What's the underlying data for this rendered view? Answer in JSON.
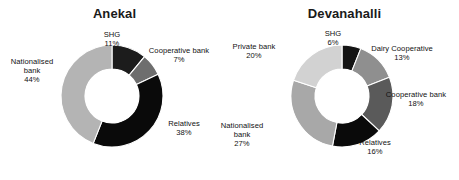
{
  "figure": {
    "background": "#ffffff",
    "width": 459,
    "height": 180
  },
  "chart_data": [
    {
      "type": "pie",
      "variant": "donut",
      "title": "Anekal",
      "xlabel": "",
      "ylabel": "",
      "legend_position": "none",
      "grid": false,
      "value_suffix": "%",
      "total": 100,
      "categories": [
        "SHG",
        "Cooperative bank",
        "Relatives",
        "Nationalised bank"
      ],
      "values": [
        11,
        7,
        38,
        44
      ],
      "labels": [
        "11%",
        "7%",
        "38%",
        "44%"
      ],
      "colors": [
        "#1c1c1c",
        "#6e6e6e",
        "#0a0a0a",
        "#b4b4b4"
      ],
      "slices": [
        {
          "name": "SHG",
          "value": 11,
          "label": "11%",
          "color": "#1c1c1c",
          "label_lines": [
            "SHG",
            "11%"
          ]
        },
        {
          "name": "Cooperative bank",
          "value": 7,
          "label": "7%",
          "color": "#6e6e6e",
          "label_lines": [
            "Cooperative bank",
            "7%"
          ]
        },
        {
          "name": "Relatives",
          "value": 38,
          "label": "38%",
          "color": "#0a0a0a",
          "label_lines": [
            "Relatives",
            "38%"
          ]
        },
        {
          "name": "Nationalised bank",
          "value": 44,
          "label": "44%",
          "color": "#b4b4b4",
          "label_lines": [
            "Nationalised",
            "bank",
            "44%"
          ]
        }
      ]
    },
    {
      "type": "pie",
      "variant": "donut",
      "title": "Devanahalli",
      "xlabel": "",
      "ylabel": "",
      "legend_position": "none",
      "grid": false,
      "value_suffix": "%",
      "total": 100,
      "categories": [
        "SHG",
        "Dairy Cooperative",
        "Cooperative bank",
        "Relatives",
        "Nationalised bank",
        "Private bank"
      ],
      "values": [
        6,
        13,
        18,
        16,
        27,
        20
      ],
      "labels": [
        "6%",
        "13%",
        "18%",
        "16%",
        "27%",
        "20%"
      ],
      "colors": [
        "#141414",
        "#8f8f8f",
        "#5a5a5a",
        "#0a0a0a",
        "#a8a8a8",
        "#d2d2d2"
      ],
      "slices": [
        {
          "name": "SHG",
          "value": 6,
          "label": "6%",
          "color": "#141414",
          "label_lines": [
            "SHG",
            "6%"
          ]
        },
        {
          "name": "Dairy Cooperative",
          "value": 13,
          "label": "13%",
          "color": "#8f8f8f",
          "label_lines": [
            "Dairy Cooperative",
            "13%"
          ]
        },
        {
          "name": "Cooperative bank",
          "value": 18,
          "label": "18%",
          "color": "#5a5a5a",
          "label_lines": [
            "Cooperative bank",
            "18%"
          ]
        },
        {
          "name": "Relatives",
          "value": 16,
          "label": "16%",
          "color": "#0a0a0a",
          "label_lines": [
            "Relatives",
            "16%"
          ]
        },
        {
          "name": "Nationalised bank",
          "value": 27,
          "label": "27%",
          "color": "#a8a8a8",
          "label_lines": [
            "Nationalised",
            "bank",
            "27%"
          ]
        },
        {
          "name": "Private bank",
          "value": 20,
          "label": "20%",
          "color": "#d2d2d2",
          "label_lines": [
            "Private bank",
            "20%"
          ]
        }
      ]
    }
  ],
  "geometry": {
    "anekal": {
      "cx": 112,
      "cy": 96,
      "outer_r": 51,
      "inner_r": 27,
      "start_angle_deg": 0,
      "labels": [
        {
          "for": "SHG",
          "x": 84,
          "y": 30,
          "w": 56,
          "align": "center"
        },
        {
          "for": "Cooperative bank",
          "x": 141,
          "y": 46,
          "w": 76,
          "align": "center"
        },
        {
          "for": "Relatives",
          "x": 158,
          "y": 119,
          "w": 52,
          "align": "center"
        },
        {
          "for": "Nationalised bank",
          "x": 2,
          "y": 57,
          "w": 60,
          "align": "center"
        }
      ]
    },
    "devanahalli": {
      "cx": 112,
      "cy": 96,
      "outer_r": 51,
      "inner_r": 27,
      "start_angle_deg": 0,
      "labels": [
        {
          "for": "SHG",
          "x": 78,
          "y": 29,
          "w": 50,
          "align": "center"
        },
        {
          "for": "Dairy Cooperative",
          "x": 130,
          "y": 44,
          "w": 84,
          "align": "center"
        },
        {
          "for": "Cooperative bank",
          "x": 146,
          "y": 90,
          "w": 80,
          "align": "center"
        },
        {
          "for": "Relatives",
          "x": 120,
          "y": 138,
          "w": 50,
          "align": "center"
        },
        {
          "for": "Nationalised bank",
          "x": -18,
          "y": 121,
          "w": 60,
          "align": "center"
        },
        {
          "for": "Private bank",
          "x": -6,
          "y": 42,
          "w": 60,
          "align": "center"
        }
      ]
    }
  }
}
